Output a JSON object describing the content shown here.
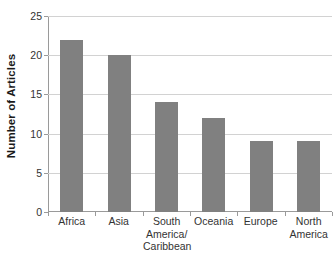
{
  "chart_data": {
    "type": "bar",
    "title": "",
    "xlabel": "",
    "ylabel": "Number of Articles",
    "categories": [
      "Africa",
      "South America/ Caribbean",
      "Asia",
      "Oceania",
      "Europe",
      "North America"
    ],
    "category_lines": [
      [
        "Africa"
      ],
      [
        "Asia"
      ],
      [
        "South",
        "America/",
        "Caribbean"
      ],
      [
        "Oceania"
      ],
      [
        "Europe"
      ],
      [
        "North",
        "America"
      ]
    ],
    "values": [
      22,
      20,
      14,
      12,
      9,
      9
    ],
    "ylim": [
      0,
      25
    ],
    "ytick_labels": [
      "0",
      "5",
      "10",
      "15",
      "20",
      "25"
    ],
    "ytick_values": [
      0,
      5,
      10,
      15,
      20,
      25
    ],
    "grid": true,
    "legend": "none",
    "bar_color": "#808080",
    "gridline_color": "#d2d2d2",
    "axis_color": "#9a9a9a",
    "background": "#ffffff"
  }
}
